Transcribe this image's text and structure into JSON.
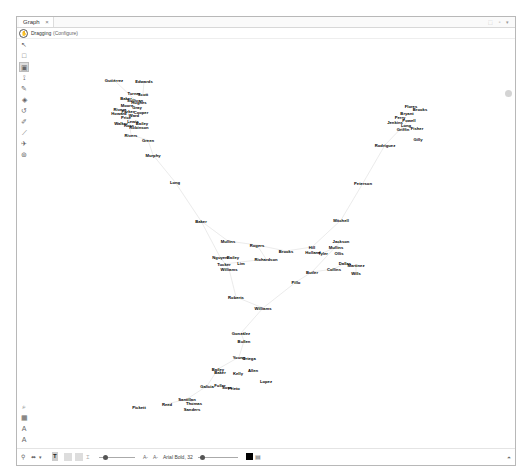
{
  "window": {
    "tab_title": "Graph",
    "tab_close": "×",
    "controls": "⬚ ▫ ▾"
  },
  "mode": {
    "label": "Dragging",
    "configure": "(Configure)"
  },
  "left_tools": [
    {
      "name": "pointer-icon",
      "glyph": "↖"
    },
    {
      "name": "rectangle-select-icon",
      "glyph": "□"
    },
    {
      "name": "direct-select-icon",
      "glyph": "▣",
      "selected": true
    },
    {
      "name": "lasso-icon",
      "glyph": "⟟"
    },
    {
      "name": "pencil-icon",
      "glyph": "✎"
    },
    {
      "name": "painter-icon",
      "glyph": "◈"
    },
    {
      "name": "shortest-path-icon",
      "glyph": "↺"
    },
    {
      "name": "brush-icon",
      "glyph": "✐"
    },
    {
      "name": "edge-pencil-icon",
      "glyph": "⟋"
    },
    {
      "name": "plane-icon",
      "glyph": "✈"
    },
    {
      "name": "heatmap-icon",
      "glyph": "⊚"
    }
  ],
  "left_tools_bottom": [
    {
      "name": "search-icon",
      "glyph": "⌕"
    },
    {
      "name": "screenshot-icon",
      "glyph": "▦"
    },
    {
      "name": "text-size-icon",
      "glyph": "A"
    },
    {
      "name": "text-color-icon",
      "glyph": "A"
    }
  ],
  "bottom_bar": {
    "bulb": "💡",
    "edge_type": "⬌",
    "edge_dropdown": "▾",
    "text_icon": "T",
    "font_decrease": "A-",
    "font_increase": "A-",
    "font_label": "Arial Bold, 32",
    "color": "#000000",
    "settings_glyph": "▤",
    "corner_glyph": "⏶"
  },
  "graph": {
    "edge_color": "#e2e2e2",
    "nodes": [
      {
        "label": "Gutiérrez",
        "x": 113,
        "y": 79
      },
      {
        "label": "Edwards",
        "x": 143,
        "y": 80
      },
      {
        "label": "Turner",
        "x": 133,
        "y": 92
      },
      {
        "label": "Scott",
        "x": 142,
        "y": 93
      },
      {
        "label": "Baker",
        "x": 125,
        "y": 97
      },
      {
        "label": "Sullivan",
        "x": 134,
        "y": 99
      },
      {
        "label": "Hughes",
        "x": 138,
        "y": 101
      },
      {
        "label": "Moore",
        "x": 126,
        "y": 104
      },
      {
        "label": "Gray",
        "x": 136,
        "y": 106
      },
      {
        "label": "Rivera",
        "x": 119,
        "y": 108
      },
      {
        "label": "Parker",
        "x": 127,
        "y": 110
      },
      {
        "label": "Cooper",
        "x": 140,
        "y": 111
      },
      {
        "label": "Howard",
        "x": 118,
        "y": 112
      },
      {
        "label": "Ward",
        "x": 133,
        "y": 114
      },
      {
        "label": "Price",
        "x": 125,
        "y": 116
      },
      {
        "label": "Walker",
        "x": 120,
        "y": 122
      },
      {
        "label": "Lewis",
        "x": 132,
        "y": 120
      },
      {
        "label": "Bailey",
        "x": 141,
        "y": 122
      },
      {
        "label": "Ross",
        "x": 128,
        "y": 124
      },
      {
        "label": "Robinson",
        "x": 138,
        "y": 126
      },
      {
        "label": "Rivers",
        "x": 130,
        "y": 134
      },
      {
        "label": "Green",
        "x": 147,
        "y": 139
      },
      {
        "label": "Murphy",
        "x": 152,
        "y": 154
      },
      {
        "label": "Long",
        "x": 174,
        "y": 181
      },
      {
        "label": "Baker",
        "x": 200,
        "y": 220
      },
      {
        "label": "Flores",
        "x": 410,
        "y": 105
      },
      {
        "label": "Brooks",
        "x": 419,
        "y": 108
      },
      {
        "label": "Bryant",
        "x": 406,
        "y": 112
      },
      {
        "label": "Perry",
        "x": 399,
        "y": 116
      },
      {
        "label": "Powell",
        "x": 408,
        "y": 119
      },
      {
        "label": "Jenkins",
        "x": 394,
        "y": 121
      },
      {
        "label": "Long",
        "x": 405,
        "y": 124
      },
      {
        "label": "Fisher",
        "x": 416,
        "y": 127
      },
      {
        "label": "Griffin",
        "x": 402,
        "y": 128
      },
      {
        "label": "Gilly",
        "x": 417,
        "y": 138
      },
      {
        "label": "Rodriguez",
        "x": 384,
        "y": 144
      },
      {
        "label": "Peterson",
        "x": 362,
        "y": 182
      },
      {
        "label": "Mitchell",
        "x": 340,
        "y": 219
      },
      {
        "label": "Jackson",
        "x": 340,
        "y": 240
      },
      {
        "label": "Hill",
        "x": 311,
        "y": 246
      },
      {
        "label": "Mullins",
        "x": 335,
        "y": 246
      },
      {
        "label": "Holland",
        "x": 312,
        "y": 251
      },
      {
        "label": "Tyler",
        "x": 322,
        "y": 252
      },
      {
        "label": "Ollis",
        "x": 338,
        "y": 252
      },
      {
        "label": "Dallas",
        "x": 344,
        "y": 262
      },
      {
        "label": "Martinez",
        "x": 355,
        "y": 264
      },
      {
        "label": "Collins",
        "x": 333,
        "y": 268
      },
      {
        "label": "Wills",
        "x": 355,
        "y": 272
      },
      {
        "label": "Butler",
        "x": 311,
        "y": 271
      },
      {
        "label": "Mullins",
        "x": 227,
        "y": 240
      },
      {
        "label": "Rogers",
        "x": 256,
        "y": 244
      },
      {
        "label": "Brooks",
        "x": 285,
        "y": 250
      },
      {
        "label": "Nguyen",
        "x": 219,
        "y": 256
      },
      {
        "label": "Bailey",
        "x": 232,
        "y": 256
      },
      {
        "label": "Richardson",
        "x": 265,
        "y": 258
      },
      {
        "label": "Tucker",
        "x": 223,
        "y": 263
      },
      {
        "label": "Lim",
        "x": 240,
        "y": 262
      },
      {
        "label": "Williams",
        "x": 228,
        "y": 268
      },
      {
        "label": "Pillo",
        "x": 295,
        "y": 281
      },
      {
        "label": "Roberts",
        "x": 235,
        "y": 296
      },
      {
        "label": "Williams",
        "x": 262,
        "y": 307
      },
      {
        "label": "González",
        "x": 240,
        "y": 332
      },
      {
        "label": "Bullen",
        "x": 243,
        "y": 340
      },
      {
        "label": "Young",
        "x": 238,
        "y": 356
      },
      {
        "label": "Ortega",
        "x": 248,
        "y": 357
      },
      {
        "label": "Allen",
        "x": 252,
        "y": 369
      },
      {
        "label": "Bailey",
        "x": 217,
        "y": 368
      },
      {
        "label": "Baker",
        "x": 219,
        "y": 371
      },
      {
        "label": "Kelly",
        "x": 237,
        "y": 372
      },
      {
        "label": "Lopez",
        "x": 265,
        "y": 380
      },
      {
        "label": "Galicia",
        "x": 206,
        "y": 385
      },
      {
        "label": "Fuller",
        "x": 219,
        "y": 384
      },
      {
        "label": "Sosa",
        "x": 226,
        "y": 386
      },
      {
        "label": "Prieto",
        "x": 233,
        "y": 387
      },
      {
        "label": "Santillan",
        "x": 186,
        "y": 398
      },
      {
        "label": "Thomas",
        "x": 193,
        "y": 402
      },
      {
        "label": "Reed",
        "x": 166,
        "y": 403
      },
      {
        "label": "Sanders",
        "x": 191,
        "y": 408
      },
      {
        "label": "Pickett",
        "x": 138,
        "y": 406
      }
    ]
  }
}
